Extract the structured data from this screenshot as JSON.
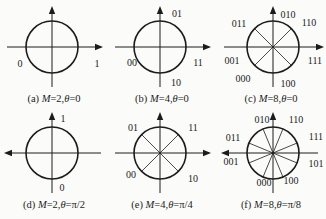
{
  "figure": {
    "background": "#fbfbf9",
    "ink": "#1c1c1c",
    "panels": [
      {
        "id": "a",
        "caption": {
          "text": "(a) M=2,θ=0",
          "prefix": "(a) ",
          "var1": "M",
          "mid": "=2,",
          "var2": "θ",
          "suffix": "=0"
        },
        "axes": {
          "horizontal_arrow": "right",
          "vertical_arrow": "up"
        },
        "geometry": {
          "cx": 52,
          "cy": 45,
          "r": 26,
          "diameters_deg": []
        },
        "labels": [
          {
            "text": "0",
            "x": 20,
            "y": 61
          },
          {
            "text": "1",
            "x": 97,
            "y": 61
          }
        ]
      },
      {
        "id": "b",
        "caption": {
          "text": "(b) M=4,θ=0",
          "prefix": "(b) ",
          "var1": "M",
          "mid": "=4,",
          "var2": "θ",
          "suffix": "=0"
        },
        "axes": {
          "horizontal_arrow": "right",
          "vertical_arrow": "up"
        },
        "geometry": {
          "cx": 52,
          "cy": 45,
          "r": 26,
          "diameters_deg": []
        },
        "labels": [
          {
            "text": "01",
            "x": 69,
            "y": 11
          },
          {
            "text": "00",
            "x": 24,
            "y": 60
          },
          {
            "text": "11",
            "x": 90,
            "y": 60
          },
          {
            "text": "10",
            "x": 68,
            "y": 80
          }
        ]
      },
      {
        "id": "c",
        "caption": {
          "text": "(c) M=8,θ=0",
          "prefix": "(c) ",
          "var1": "M",
          "mid": "=8,",
          "var2": "θ",
          "suffix": "=0"
        },
        "axes": {
          "horizontal_arrow": "right",
          "vertical_arrow": "up"
        },
        "geometry": {
          "cx": 56,
          "cy": 45,
          "r": 26,
          "diameters_deg": [
            45,
            135
          ]
        },
        "labels": [
          {
            "text": "010",
            "x": 71,
            "y": 12
          },
          {
            "text": "011",
            "x": 22,
            "y": 21
          },
          {
            "text": "110",
            "x": 92,
            "y": 20
          },
          {
            "text": "001",
            "x": 15,
            "y": 58
          },
          {
            "text": "111",
            "x": 98,
            "y": 58
          },
          {
            "text": "000",
            "x": 26,
            "y": 76
          },
          {
            "text": "100",
            "x": 71,
            "y": 81
          }
        ]
      },
      {
        "id": "d",
        "caption": {
          "text": "(d) M=2,θ=π/2",
          "prefix": "(d) ",
          "var1": "M",
          "mid": "=2,",
          "var2": "θ",
          "suffix": "=π/2"
        },
        "axes": {
          "horizontal_arrow": "left",
          "vertical_arrow": "up"
        },
        "geometry": {
          "cx": 52,
          "cy": 45,
          "r": 26,
          "diameters_deg": []
        },
        "labels": [
          {
            "text": "1",
            "x": 63,
            "y": 10
          },
          {
            "text": "0",
            "x": 62,
            "y": 79
          }
        ]
      },
      {
        "id": "e",
        "caption": {
          "text": "(e) M=4,θ=π/4",
          "prefix": "(e) ",
          "var1": "M",
          "mid": "=4,",
          "var2": "θ",
          "suffix": "=π/4"
        },
        "axes": {
          "horizontal_arrow": "right",
          "vertical_arrow": "up"
        },
        "geometry": {
          "cx": 52,
          "cy": 45,
          "r": 26,
          "diameters_deg": [
            45,
            135
          ]
        },
        "labels": [
          {
            "text": "01",
            "x": 25,
            "y": 19
          },
          {
            "text": "11",
            "x": 85,
            "y": 19
          },
          {
            "text": "00",
            "x": 23,
            "y": 66
          },
          {
            "text": "10",
            "x": 85,
            "y": 70
          }
        ]
      },
      {
        "id": "f",
        "caption": {
          "text": "(f) M=8,θ=π/8",
          "prefix": "(f) ",
          "var1": "M",
          "mid": "=8,",
          "var2": "θ",
          "suffix": "=π/8"
        },
        "axes": {
          "horizontal_arrow": "left",
          "vertical_arrow": "up"
        },
        "geometry": {
          "cx": 56,
          "cy": 45,
          "r": 26,
          "diameters_deg": [
            22.5,
            67.5,
            112.5,
            157.5
          ]
        },
        "labels": [
          {
            "text": "010",
            "x": 45,
            "y": 11
          },
          {
            "text": "110",
            "x": 79,
            "y": 11
          },
          {
            "text": "011",
            "x": 16,
            "y": 29
          },
          {
            "text": "111",
            "x": 99,
            "y": 28
          },
          {
            "text": "001",
            "x": 14,
            "y": 53
          },
          {
            "text": "101",
            "x": 99,
            "y": 55
          },
          {
            "text": "000",
            "x": 47,
            "y": 74
          },
          {
            "text": "100",
            "x": 74,
            "y": 72
          }
        ]
      }
    ]
  }
}
